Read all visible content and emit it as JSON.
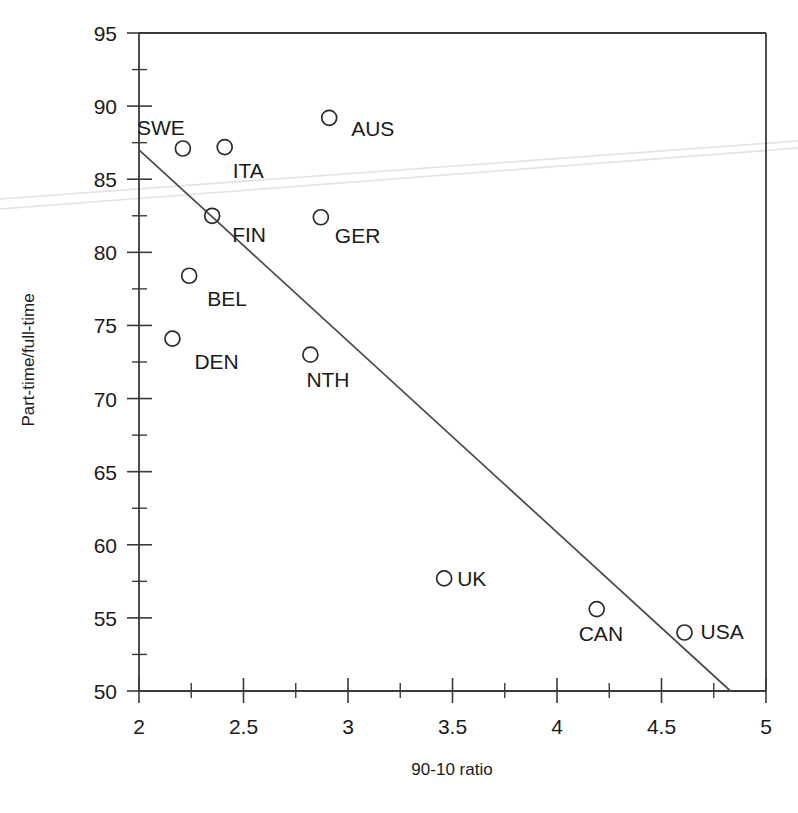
{
  "chart_data": {
    "type": "scatter",
    "title": "",
    "xlabel": "90-10 ratio",
    "ylabel": "Part-time/full-time",
    "xlim": [
      2,
      5
    ],
    "ylim": [
      50,
      95
    ],
    "xticks": [
      2,
      2.5,
      3,
      3.5,
      4,
      4.5,
      5
    ],
    "xtick_labels": [
      "2",
      "2.5",
      "3",
      "3.5",
      "4",
      "4.5",
      "5"
    ],
    "xtick_minor_step": 0.25,
    "yticks": [
      50,
      55,
      60,
      65,
      70,
      75,
      80,
      85,
      90,
      95
    ],
    "ytick_labels": [
      "50",
      "55",
      "60",
      "65",
      "70",
      "75",
      "80",
      "85",
      "90",
      "95"
    ],
    "ytick_minor_step": 2.5,
    "grid": false,
    "legend": "none",
    "marker_style": "open-circle",
    "points": [
      {
        "label": "SWE",
        "x": 2.21,
        "y": 87.1,
        "label_dx": -46,
        "label_dy": -14
      },
      {
        "label": "ITA",
        "x": 2.41,
        "y": 87.2,
        "label_dx": 8,
        "label_dy": 31
      },
      {
        "label": "AUS",
        "x": 2.91,
        "y": 89.2,
        "label_dx": 22,
        "label_dy": 18
      },
      {
        "label": "FIN",
        "x": 2.35,
        "y": 82.5,
        "label_dx": 20,
        "label_dy": 26
      },
      {
        "label": "GER",
        "x": 2.87,
        "y": 82.4,
        "label_dx": 14,
        "label_dy": 26
      },
      {
        "label": "BEL",
        "x": 2.24,
        "y": 78.4,
        "label_dx": 18,
        "label_dy": 30
      },
      {
        "label": "DEN",
        "x": 2.16,
        "y": 74.1,
        "label_dx": 22,
        "label_dy": 30
      },
      {
        "label": "NTH",
        "x": 2.82,
        "y": 73.0,
        "label_dx": -4,
        "label_dy": 32
      },
      {
        "label": "UK",
        "x": 3.46,
        "y": 57.7,
        "label_dx": 13,
        "label_dy": 8
      },
      {
        "label": "CAN",
        "x": 4.19,
        "y": 55.6,
        "label_dx": -18,
        "label_dy": 32
      },
      {
        "label": "USA",
        "x": 4.61,
        "y": 54.0,
        "label_dx": 16,
        "label_dy": 6
      }
    ],
    "trendline": {
      "description": "downward-sloping fitted regression line",
      "x_start": 2.0,
      "y_start": 87.0,
      "x_end": 4.83,
      "y_end": 50.0
    },
    "scan_artifact": {
      "description": "faint light-grey scan streak across full image width",
      "visible": true
    }
  }
}
